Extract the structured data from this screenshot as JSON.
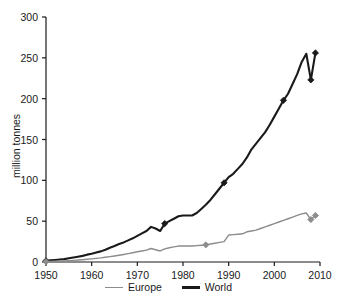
{
  "chart_data": {
    "type": "line",
    "title": "",
    "subtitle": "",
    "xlabel": "",
    "ylabel": "million tonnes",
    "xlim": [
      1950,
      2010
    ],
    "ylim": [
      0,
      300
    ],
    "xticks": [
      1950,
      1960,
      1970,
      1980,
      1990,
      2000,
      2010
    ],
    "yticks": [
      0,
      50,
      100,
      150,
      200,
      250,
      300
    ],
    "xtick_labels": [
      "1950",
      "1960",
      "1970",
      "1980",
      "1990",
      "2000",
      "2010"
    ],
    "ytick_labels": [
      "0",
      "50",
      "100",
      "150",
      "200",
      "250",
      "300"
    ],
    "grid": false,
    "legend_position": "bottom-center",
    "legend": [
      "Europe",
      "World"
    ],
    "series": [
      {
        "name": "World",
        "color": "#1a1a1a",
        "line_width": 2.1,
        "marker": "diamond",
        "marker_years": [
          1950,
          1976,
          1989,
          2002,
          2008,
          2009
        ],
        "marker_values": [
          1.5,
          47,
          97,
          198,
          223,
          256
        ],
        "x": [
          1950,
          1951,
          1952,
          1953,
          1954,
          1955,
          1956,
          1957,
          1958,
          1959,
          1960,
          1961,
          1962,
          1963,
          1964,
          1965,
          1966,
          1967,
          1968,
          1969,
          1970,
          1971,
          1972,
          1973,
          1974,
          1975,
          1976,
          1977,
          1978,
          1979,
          1980,
          1981,
          1982,
          1983,
          1984,
          1985,
          1986,
          1987,
          1988,
          1989,
          1990,
          1991,
          1992,
          1993,
          1994,
          1995,
          1996,
          1997,
          1998,
          1999,
          2000,
          2001,
          2002,
          2003,
          2004,
          2005,
          2006,
          2007,
          2008,
          2009
        ],
        "values": [
          1.5,
          2,
          2.5,
          3,
          3.5,
          4.5,
          5.5,
          6.5,
          7.5,
          9,
          10,
          11.5,
          13,
          15,
          17.5,
          19.5,
          22,
          24,
          26.5,
          29,
          32,
          35,
          38,
          43,
          41,
          38,
          47,
          50,
          53,
          56,
          57,
          57,
          57,
          60,
          65,
          70,
          76,
          83,
          90,
          97,
          104,
          108,
          114,
          120,
          128,
          138,
          145,
          152,
          159,
          168,
          178,
          188,
          198,
          206,
          218,
          230,
          245,
          255,
          223,
          256
        ]
      },
      {
        "name": "Europe",
        "color": "#8c8c8c",
        "line_width": 1.4,
        "marker": "diamond",
        "marker_years": [
          1950,
          1985,
          2008,
          2009
        ],
        "marker_values": [
          0.5,
          21,
          52,
          57
        ],
        "x": [
          1950,
          1951,
          1952,
          1953,
          1954,
          1955,
          1956,
          1957,
          1958,
          1959,
          1960,
          1961,
          1962,
          1963,
          1964,
          1965,
          1966,
          1967,
          1968,
          1969,
          1970,
          1971,
          1972,
          1973,
          1974,
          1975,
          1976,
          1977,
          1978,
          1979,
          1980,
          1981,
          1982,
          1983,
          1984,
          1985,
          1986,
          1987,
          1988,
          1989,
          1990,
          1991,
          1992,
          1993,
          1994,
          1995,
          1996,
          1997,
          1998,
          1999,
          2000,
          2001,
          2002,
          2003,
          2004,
          2005,
          2006,
          2007,
          2008,
          2009
        ],
        "values": [
          0.5,
          0.7,
          0.9,
          1.1,
          1.4,
          1.7,
          2,
          2.4,
          2.8,
          3.3,
          3.8,
          4.4,
          5,
          5.8,
          6.6,
          7.4,
          8.3,
          9.2,
          10.2,
          11.3,
          12.5,
          13.5,
          14.5,
          16.5,
          15,
          13.5,
          16,
          17.5,
          18.5,
          19.5,
          19.5,
          19.5,
          19.5,
          20,
          20.5,
          21,
          22,
          23,
          24,
          25,
          33,
          33.5,
          34,
          34.5,
          37,
          38,
          39,
          41,
          43,
          45,
          47,
          49,
          51,
          53,
          55,
          57,
          59,
          60,
          52,
          57
        ]
      }
    ]
  },
  "axis": {
    "y_label": "million tonnes"
  },
  "legend": {
    "items": [
      {
        "label": "Europe",
        "kind": "europe"
      },
      {
        "label": "World",
        "kind": "world"
      }
    ]
  }
}
